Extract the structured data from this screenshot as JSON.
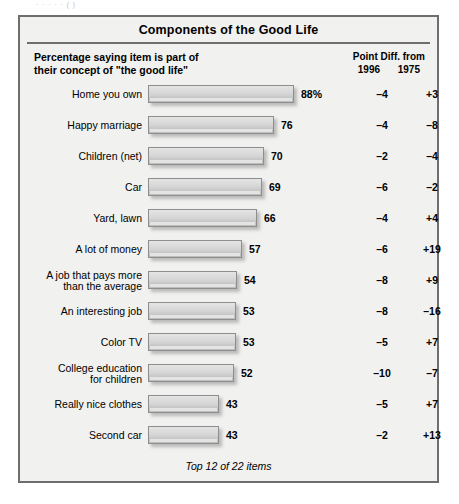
{
  "scan": {
    "top_cut_text": "·  ·       ·        ·              ·                                                      (     )"
  },
  "panel": {
    "title": "Components of the Good Life",
    "header": {
      "left_line1": "Percentage saying item is part of",
      "left_line2": "their concept of \"the good life\"",
      "right_title": "Point Diff. from",
      "right_year_a": "1996",
      "right_year_b": "1975"
    },
    "footnote": "Top 12 of 22 items"
  },
  "chart_data": {
    "type": "bar",
    "title": "Components of the Good Life",
    "subtitle": "Percentage saying item is part of their concept of \"the good life\"",
    "orientation": "horizontal",
    "xlabel": "",
    "ylabel": "",
    "xlim": [
      0,
      100
    ],
    "grid": false,
    "legend": null,
    "annotation": "Top 12 of 22 items",
    "categories": [
      "Home you own",
      "Happy marriage",
      "Children (net)",
      "Car",
      "Yard, lawn",
      "A lot of money",
      "A job that pays more\nthan the average",
      "An interesting job",
      "Color TV",
      "College education\nfor children",
      "Really nice clothes",
      "Second car"
    ],
    "values": [
      88,
      76,
      70,
      69,
      66,
      57,
      54,
      53,
      53,
      52,
      43,
      43
    ],
    "value_labels": [
      "88%",
      "76",
      "70",
      "69",
      "66",
      "57",
      "54",
      "53",
      "53",
      "52",
      "43",
      "43"
    ],
    "series": [
      {
        "name": "Percentage saying item is part of their concept of \"the good life\"",
        "values": [
          88,
          76,
          70,
          69,
          66,
          57,
          54,
          53,
          53,
          52,
          43,
          43
        ]
      },
      {
        "name": "Point Diff. from 1996",
        "values": [
          -4,
          -4,
          -2,
          -6,
          -4,
          -6,
          -8,
          -8,
          -5,
          -10,
          -5,
          -2
        ],
        "labels": [
          "–4",
          "–4",
          "–2",
          "–6",
          "–4",
          "–6",
          "–8",
          "–8",
          "–5",
          "–10",
          "–5",
          "–2"
        ]
      },
      {
        "name": "Point Diff. from 1975",
        "values": [
          3,
          -8,
          -4,
          -2,
          4,
          19,
          9,
          -16,
          7,
          -7,
          7,
          13
        ],
        "labels": [
          "+3",
          "–8",
          "–4",
          "–2",
          "+4",
          "+19",
          "+9",
          "–16",
          "+7",
          "–7",
          "+7",
          "+13"
        ]
      }
    ],
    "rows": [
      {
        "category": "Home you own",
        "value": 88,
        "value_label": "88%",
        "diff_1996": "–4",
        "diff_1975": "+3"
      },
      {
        "category": "Happy marriage",
        "value": 76,
        "value_label": "76",
        "diff_1996": "–4",
        "diff_1975": "–8"
      },
      {
        "category": "Children (net)",
        "value": 70,
        "value_label": "70",
        "diff_1996": "–2",
        "diff_1975": "–4"
      },
      {
        "category": "Car",
        "value": 69,
        "value_label": "69",
        "diff_1996": "–6",
        "diff_1975": "–2"
      },
      {
        "category": "Yard, lawn",
        "value": 66,
        "value_label": "66",
        "diff_1996": "–4",
        "diff_1975": "+4"
      },
      {
        "category": "A lot of money",
        "value": 57,
        "value_label": "57",
        "diff_1996": "–6",
        "diff_1975": "+19"
      },
      {
        "category": "A job that pays more\nthan the average",
        "value": 54,
        "value_label": "54",
        "diff_1996": "–8",
        "diff_1975": "+9"
      },
      {
        "category": "An interesting job",
        "value": 53,
        "value_label": "53",
        "diff_1996": "–8",
        "diff_1975": "–16"
      },
      {
        "category": "Color TV",
        "value": 53,
        "value_label": "53",
        "diff_1996": "–5",
        "diff_1975": "+7"
      },
      {
        "category": "College education\nfor children",
        "value": 52,
        "value_label": "52",
        "diff_1996": "–10",
        "diff_1975": "–7"
      },
      {
        "category": "Really nice clothes",
        "value": 43,
        "value_label": "43",
        "diff_1996": "–5",
        "diff_1975": "+7"
      },
      {
        "category": "Second car",
        "value": 43,
        "value_label": "43",
        "diff_1996": "–2",
        "diff_1975": "+13"
      }
    ]
  },
  "style": {
    "panel_bg": "#f1f1f0",
    "panel_border": "#6e6e6e",
    "bar_fill": "#d4d4d4",
    "bar_border": "#8e8e8e",
    "text": "#000000",
    "px_per_unit": 1.655
  }
}
